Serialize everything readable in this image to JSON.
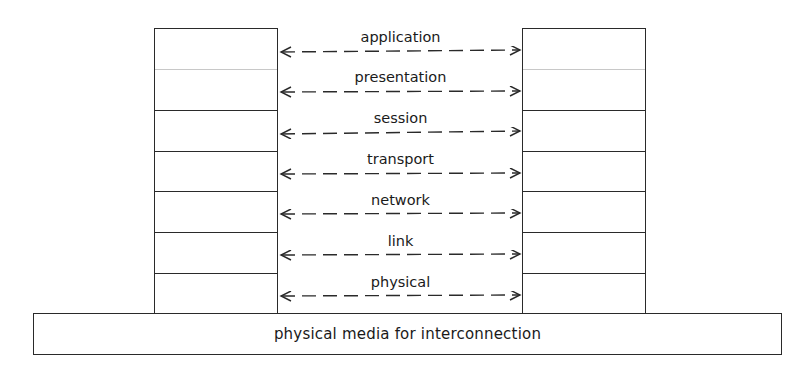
{
  "diagram": {
    "title": "",
    "left_stack": {
      "name": "left-end-system",
      "cells": 7
    },
    "right_stack": {
      "name": "right-end-system",
      "cells": 7
    },
    "layers": [
      {
        "label": "application"
      },
      {
        "label": "presentation"
      },
      {
        "label": "session"
      },
      {
        "label": "transport"
      },
      {
        "label": "network"
      },
      {
        "label": "link"
      },
      {
        "label": "physical"
      }
    ],
    "media": {
      "label": "physical media for interconnection"
    },
    "connector_style": "dashed-double-arrow",
    "line_color": "#2a2a2a"
  }
}
